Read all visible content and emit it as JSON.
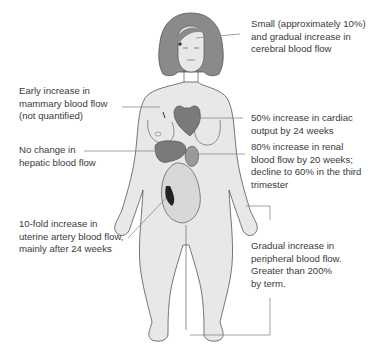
{
  "diagram": {
    "colors": {
      "skin": "#e8e8e8",
      "hair": "#8a8a8a",
      "organ": "#7a7a7a",
      "leader_line": "#8c8c8c",
      "text": "#3a3a3a"
    },
    "annotations": [
      {
        "id": "cerebral",
        "lines": [
          "Small (approximately 10%)",
          "and gradual increase in",
          "cerebral blood flow"
        ],
        "target": "brain"
      },
      {
        "id": "mammary",
        "lines": [
          "Early increase in",
          "mammary blood flow",
          "(not quantified)"
        ],
        "target": "breast"
      },
      {
        "id": "cardiac",
        "lines": [
          "50% increase in cardiac",
          "output by 24 weeks"
        ],
        "target": "heart"
      },
      {
        "id": "hepatic",
        "lines": [
          "No change in",
          "hepatic blood flow"
        ],
        "target": "liver"
      },
      {
        "id": "renal",
        "lines": [
          "80% increase in renal",
          "blood flow by 20 weeks;",
          "decline to 60% in the third",
          "trimester"
        ],
        "target": "kidney"
      },
      {
        "id": "uterine",
        "lines": [
          "10-fold increase in",
          "uterine artery blood flow,",
          "mainly after 24 weeks"
        ],
        "target": "uterus"
      },
      {
        "id": "peripheral",
        "lines": [
          "Gradual increase in",
          "peripheral blood flow.",
          "Greater than 200%",
          "by term."
        ],
        "target": "hand-and-foot"
      }
    ]
  }
}
